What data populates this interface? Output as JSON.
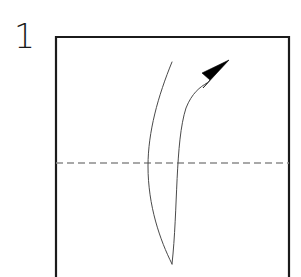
{
  "figure": {
    "kind": "origami-fold-step-diagram",
    "step_number": "1",
    "background_color": "#ffffff",
    "width": 301,
    "height": 277
  },
  "paper": {
    "name": "square-sheet",
    "outline_color": "#1b1b1b",
    "outline_width": 2.2,
    "fill_color": "#ffffff",
    "left": 56,
    "top": 37,
    "right": 289,
    "bottom": 277
  },
  "fold_line": {
    "name": "horizontal-valley-fold-crease",
    "style": "dashed",
    "color": "#8c8c8c",
    "stroke_width": 1.3,
    "dash": "7 4",
    "y": 163,
    "x_start": 56,
    "x_end": 289
  },
  "fold_arrow": {
    "name": "fold-direction-arrow",
    "color": "#3a3a3a",
    "stroke_width": 1.1,
    "head_color": "#000000",
    "tip_x": 228,
    "tip_y": 61,
    "tail_x": 172,
    "tail_y": 264,
    "path": "M 172 264 C 178 210 176 140 186 108 C 193 94 200 88 207 83",
    "head_path": "M 228 61 L 204 76 L 211 82 L 206 88 Z"
  },
  "fold_edge_line": {
    "name": "folded-edge-curve",
    "color": "#4a4a4a",
    "stroke_width": 1.0,
    "path": "M 172 62 C 158 96 148 132 148 166 C 148 206 160 240 172 264"
  },
  "labels": {
    "step_number_name": "step-number-1",
    "diagram_title": "1"
  }
}
